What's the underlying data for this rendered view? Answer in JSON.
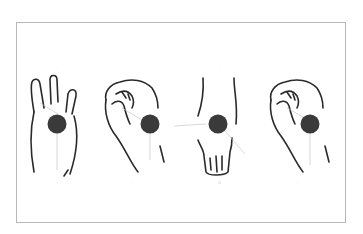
{
  "figure": {
    "type": "hand-illustration-panel",
    "frame_color": "#b8b8b8",
    "ink_color": "#2a2a2a",
    "marker_color": "#3a3a3a",
    "leader_color": "#bdbdbd",
    "panels": [
      {
        "id": "open-palm",
        "description": "open hand, three fingers up, palm facing",
        "top_label": "·",
        "bottom_label": "··"
      },
      {
        "id": "curled-fist-side",
        "description": "hand curled with fingers folded, side view",
        "top_label": "·",
        "bottom_label": "··"
      },
      {
        "id": "back-of-hand",
        "description": "back of hand / wrist, fingers pointing down",
        "top_label": "··",
        "bottom_label": "11"
      },
      {
        "id": "curled-fist-side-2",
        "description": "hand curled with fingers folded, side view (repeat)",
        "top_label": "·",
        "bottom_label": "··"
      }
    ]
  }
}
